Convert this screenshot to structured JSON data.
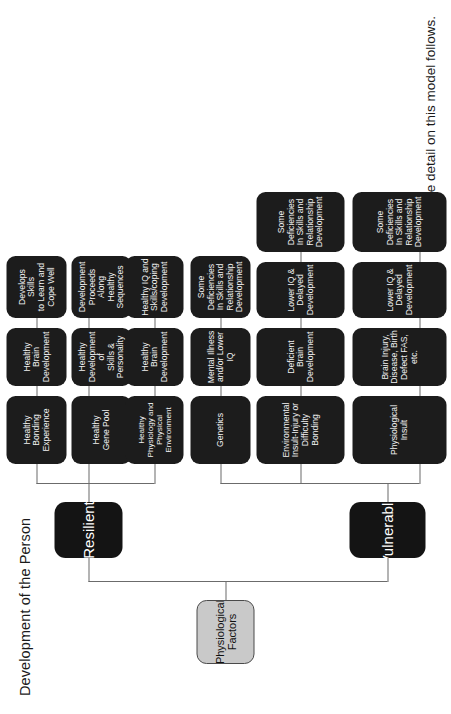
{
  "page": {
    "title": "Development of the Person",
    "footnote": "More detail on this model follows.",
    "orientation": "rotated-90-ccw"
  },
  "colors": {
    "background": "#ffffff",
    "root_fill": "#c9c9c9",
    "root_border": "#4a4a4a",
    "root_text": "#111111",
    "node_fill": "#1c1c1c",
    "branch_fill": "#141414",
    "node_text": "#f2f2f2",
    "connector": "#6b6b6b"
  },
  "chart_data": {
    "type": "tree",
    "title": "Development of the Person",
    "root": {
      "label": "Physiological\nFactors",
      "label_lines": [
        "Physiological",
        "Factors"
      ]
    },
    "branches": [
      {
        "label": "Resilient",
        "columns": [
          {
            "index": 0,
            "levels": [
              "Healthy\nPhysiology and\nPhysical\nEnvironment",
              "Healthy\nBrain\nDevelopment",
              "Healthy IQ and\nSkills/coping\nDevelopment"
            ]
          },
          {
            "index": 1,
            "levels": [
              "Healthy\nGene Pool",
              "Healthy\nDevelopment of\nSkills & Personality",
              "Development\nProceeds Along\nHealthy Sequences"
            ]
          },
          {
            "index": 2,
            "levels": [
              "Healthy\nBonding\nExperience",
              "Healthy\nBrain\nDevelopment",
              "Develops Skills\nto Learn and\nCope Well"
            ]
          }
        ]
      },
      {
        "label": "Vulnerable",
        "columns": [
          {
            "index": 0,
            "levels": [
              "Genetics",
              "Mental Illness\nand/or Lower IQ",
              "Some Deficiencies\nIn Skills and\nRelationship\nDevelopment"
            ]
          },
          {
            "index": 1,
            "levels": [
              "Environmental\nInsult-Injury or\nDifficulty Bonding",
              "Deficient\nBrain\nDevelopment",
              "Lower IQ &\nDelayed\nDevelopment",
              "Some Deficiencies\nIn Skills and\nRelationship\nDevelopment"
            ]
          },
          {
            "index": 2,
            "levels": [
              "Physiological\nInsult",
              "Brain Injury,\nDisease, Birth\nDefect FAS, etc.",
              "Lower IQ &\nDelayed\nDevelopment",
              "Some Deficiencies\nIn Skills and\nRelationship\nDevelopment"
            ]
          }
        ]
      }
    ]
  },
  "nodes": {
    "root": "Physiological\nFactors",
    "branch_resilient": "Resilient",
    "branch_vulnerable": "Vulnerable",
    "r_c0_l0": "Healthy\nPhysiology and\nPhysical\nEnvironment",
    "r_c0_l1": "Healthy\nBrain\nDevelopment",
    "r_c0_l2": "Healthy IQ and\nSkills/coping\nDevelopment",
    "r_c1_l0": "Healthy\nGene Pool",
    "r_c1_l1": "Healthy\nDevelopment of\nSkills & Personality",
    "r_c1_l2": "Development\nProceeds Along\nHealthy Sequences",
    "r_c2_l0": "Healthy\nBonding\nExperience",
    "r_c2_l1": "Healthy\nBrain\nDevelopment",
    "r_c2_l2": "Develops Skills\nto Learn and\nCope Well",
    "v_c0_l0": "Genetics",
    "v_c0_l1": "Mental Illness\nand/or Lower IQ",
    "v_c0_l2": "Some Deficiencies\nIn Skills and\nRelationship\nDevelopment",
    "v_c1_l0": "Environmental\nInsult-Injury or\nDifficulty Bonding",
    "v_c1_l1": "Deficient\nBrain\nDevelopment",
    "v_c1_l2": "Lower IQ &\nDelayed\nDevelopment",
    "v_c1_l3": "Some Deficiencies\nIn Skills and\nRelationship\nDevelopment",
    "v_c2_l0": "Physiological\nInsult",
    "v_c2_l1": "Brain Injury,\nDisease, Birth\nDefect FAS, etc.",
    "v_c2_l2": "Lower IQ &\nDelayed\nDevelopment",
    "v_c2_l3": "Some Deficiencies\nIn Skills and\nRelationship\nDevelopment"
  }
}
